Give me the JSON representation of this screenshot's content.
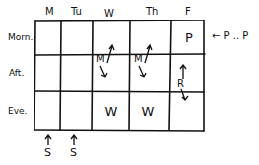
{
  "days": [
    "M",
    "Tu",
    "W",
    "Th",
    "F"
  ],
  "periods": [
    "Morn.",
    "Aft.",
    "Eve."
  ],
  "cells": {
    "friday_morning": "P",
    "wednesday_afternoon": "M",
    "thursday_afternoon": "M",
    "friday_afternoon": "R",
    "wednesday_evening": "W",
    "thursday_evening": "W"
  },
  "annotations": {
    "right_side": "← P .. P",
    "below_monday": "S",
    "below_tuesday": "S"
  }
}
